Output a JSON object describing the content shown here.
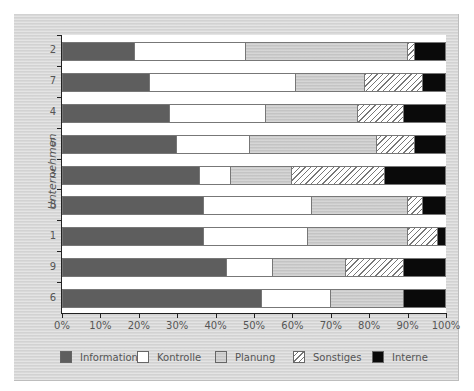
{
  "chart_data": {
    "type": "bar",
    "orientation": "horizontal",
    "stacked": true,
    "normalized": true,
    "title": "",
    "xlabel": "",
    "ylabel": "Unternehmen",
    "xlim": [
      0,
      100
    ],
    "x_ticks": [
      "0%",
      "10%",
      "20%",
      "30%",
      "40%",
      "50%",
      "60%",
      "70%",
      "80%",
      "90%",
      "100%"
    ],
    "categories": [
      "2",
      "7",
      "4",
      "5",
      "3",
      "8",
      "1",
      "9",
      "6"
    ],
    "series": [
      {
        "name": "Information",
        "color": "#5e5e5e",
        "pattern": "solid-dark-grey",
        "values": [
          19,
          23,
          28,
          30,
          36,
          37,
          37,
          43,
          52
        ]
      },
      {
        "name": "Kontrolle",
        "color": "#ffffff",
        "pattern": "solid-white",
        "values": [
          29,
          38,
          25,
          19,
          8,
          28,
          27,
          12,
          18
        ]
      },
      {
        "name": "Planung",
        "color": "#c4c4c4",
        "pattern": "solid-light-grey",
        "values": [
          42,
          18,
          24,
          33,
          16,
          25,
          26,
          19,
          19
        ]
      },
      {
        "name": "Sonstiges",
        "color": "#ffffff",
        "pattern": "diagonal-hatch",
        "values": [
          2,
          15,
          12,
          10,
          24,
          4,
          8,
          15,
          0
        ]
      },
      {
        "name": "Interne",
        "color": "#0a0a0a",
        "pattern": "solid-black",
        "values": [
          8,
          6,
          11,
          8,
          16,
          6,
          2,
          11,
          11
        ]
      }
    ],
    "grid": false,
    "legend_position": "bottom"
  },
  "axis": {
    "y_title": "Unternehmen",
    "x_ticks": [
      "0%",
      "10%",
      "20%",
      "30%",
      "40%",
      "50%",
      "60%",
      "70%",
      "80%",
      "90%",
      "100%"
    ],
    "y_labels": [
      "2",
      "7",
      "4",
      "5",
      "3",
      "8",
      "1",
      "9",
      "6"
    ]
  },
  "legend": [
    {
      "label": "Information",
      "key": "information"
    },
    {
      "label": "Kontrolle",
      "key": "kontrolle"
    },
    {
      "label": "Planung",
      "key": "planung"
    },
    {
      "label": "Sonstiges",
      "key": "sonstiges"
    },
    {
      "label": "Interne",
      "key": "interne"
    }
  ]
}
